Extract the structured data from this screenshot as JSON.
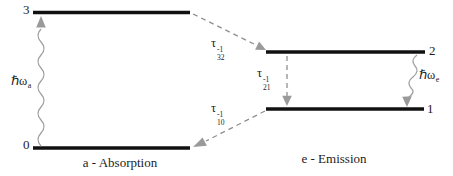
{
  "levels": {
    "three": "3",
    "two": "2",
    "one": "1",
    "zero": "0"
  },
  "rates": {
    "tau32": {
      "symbol": "τ",
      "sub": "32",
      "sup": "-1"
    },
    "tau21": {
      "symbol": "τ",
      "sub": "21",
      "sup": "-1"
    },
    "tau10": {
      "symbol": "τ",
      "sub": "10",
      "sup": "-1"
    }
  },
  "photons": {
    "absorption": {
      "symbol": "ℏω",
      "sub": "a"
    },
    "emission": {
      "symbol": "ℏω",
      "sub": "e"
    }
  },
  "captions": {
    "absorption": "a - Absorption",
    "emission": "e - Emission"
  },
  "colors": {
    "level_line": "#111111",
    "dashed_arrow": "#8f8f8f",
    "wavy_arrow": "#a0a0a0",
    "text": "#1c1c1c"
  }
}
